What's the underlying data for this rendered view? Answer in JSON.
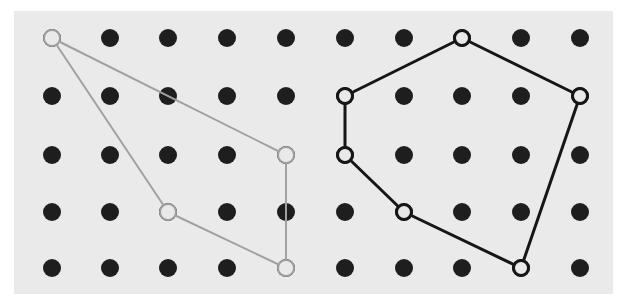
{
  "figure": {
    "background_color": "#ffffff",
    "panel_color": "#ebeaea",
    "panel": {
      "x": 14,
      "y": 11,
      "width": 599,
      "height": 283
    }
  },
  "chart_data": {
    "type": "scatter",
    "title": "",
    "subtitle": "",
    "xlabel": "",
    "ylabel": "",
    "grid": false,
    "legend_position": "none",
    "axis_visible": false,
    "tick_labels_x": [],
    "tick_labels_y": [],
    "xlim": [
      0,
      623
    ],
    "ylim": [
      298,
      0
    ],
    "grid_points": {
      "name": "lattice-dots",
      "rows": 5,
      "columns": 10,
      "column_x": [
        52,
        110,
        168,
        227,
        286,
        345,
        404,
        462,
        521,
        580
      ],
      "row_y": [
        38,
        96,
        155,
        212,
        268
      ],
      "marker": "filled-circle",
      "radius": 9,
      "color": "#1e1e1e",
      "count": 50
    },
    "series": [
      {
        "name": "gray-polygon",
        "type": "closed-polyline",
        "color": "#a0a0a0",
        "line_width": 2,
        "vertex_marker": "open-circle",
        "vertex_radius": 9,
        "vertex_count": 4,
        "closed": true,
        "points": [
          {
            "x": 52,
            "y": 38,
            "grid_col": 1,
            "grid_row": 1
          },
          {
            "x": 286,
            "y": 155,
            "grid_col": 5,
            "grid_row": 3
          },
          {
            "x": 286,
            "y": 268,
            "grid_col": 5,
            "grid_row": 5
          },
          {
            "x": 168,
            "y": 212,
            "grid_col": 3,
            "grid_row": 4
          }
        ]
      },
      {
        "name": "black-polygon",
        "type": "closed-polyline",
        "color": "#161616",
        "line_width": 3,
        "vertex_marker": "open-circle",
        "vertex_radius": 9,
        "vertex_count": 6,
        "closed": true,
        "points": [
          {
            "x": 462,
            "y": 38,
            "grid_col": 8,
            "grid_row": 1
          },
          {
            "x": 580,
            "y": 96,
            "grid_col": 10,
            "grid_row": 2
          },
          {
            "x": 521,
            "y": 268,
            "grid_col": 9,
            "grid_row": 5
          },
          {
            "x": 404,
            "y": 212,
            "grid_col": 7,
            "grid_row": 4
          },
          {
            "x": 345,
            "y": 155,
            "grid_col": 6,
            "grid_row": 3
          },
          {
            "x": 345,
            "y": 96,
            "grid_col": 6,
            "grid_row": 2
          }
        ]
      }
    ]
  }
}
